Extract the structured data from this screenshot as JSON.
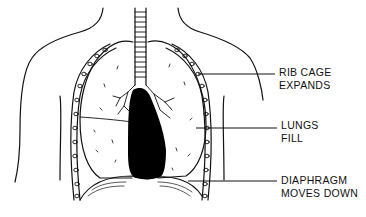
{
  "diagram": {
    "labels": [
      {
        "id": "rib-cage",
        "lines": [
          "RIB CAGE",
          "EXPANDS"
        ],
        "x": 279,
        "y": 66
      },
      {
        "id": "lungs",
        "lines": [
          "LUNGS",
          "FILL"
        ],
        "x": 281,
        "y": 119
      },
      {
        "id": "diaphragm",
        "lines": [
          "DIAPHRAGM",
          "MOVES DOWN"
        ],
        "x": 281,
        "y": 174
      }
    ],
    "leader_lines": [
      {
        "target": "rib-cage",
        "x1": 198,
        "y1": 74,
        "x2": 275,
        "y2": 74
      },
      {
        "target": "lungs",
        "x1": 196,
        "y1": 128,
        "x2": 277,
        "y2": 128
      },
      {
        "target": "diaphragm",
        "x1": 188,
        "y1": 181,
        "x2": 277,
        "y2": 181
      }
    ],
    "colors": {
      "line": "#111111",
      "fill": "#ffffff",
      "heart": "#000000"
    }
  }
}
